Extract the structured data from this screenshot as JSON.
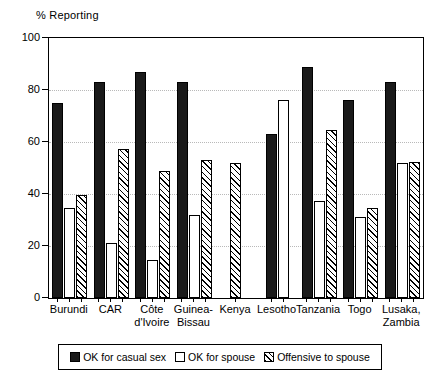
{
  "chart_data": {
    "type": "bar",
    "title": "",
    "ylabel": "% Reporting",
    "xlabel": "",
    "ylim": [
      0,
      100
    ],
    "yticks": [
      0,
      20,
      40,
      60,
      80,
      100
    ],
    "grid": true,
    "legend_position": "bottom",
    "categories": [
      "Burundi",
      "CAR",
      "Côte\nd'Ivoire",
      "Guinea-\nBissau",
      "Kenya",
      "Lesotho",
      "Tanzania",
      "Togo",
      "Lusaka,\nZambia"
    ],
    "series": [
      {
        "name": "OK for casual sex",
        "style": "black",
        "values": [
          75,
          83,
          87,
          83,
          null,
          63,
          89,
          76,
          83
        ]
      },
      {
        "name": "OK for spouse",
        "style": "white",
        "values": [
          34.5,
          21,
          14.5,
          32,
          null,
          76,
          37.5,
          31,
          52
        ]
      },
      {
        "name": "Offensive to spouse",
        "style": "hatch",
        "values": [
          39.5,
          57.5,
          49,
          53,
          52,
          null,
          64.5,
          34.5,
          52.5
        ]
      }
    ]
  }
}
